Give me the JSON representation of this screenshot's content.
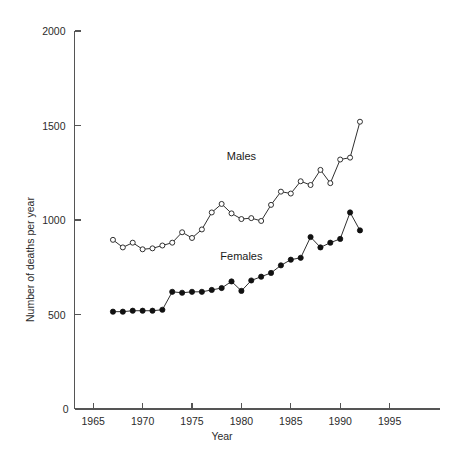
{
  "chart_data": {
    "type": "line",
    "title": "",
    "xlabel": "Year",
    "ylabel": "Number of deaths per year",
    "xlim": [
      1963,
      1997
    ],
    "ylim": [
      0,
      2000
    ],
    "grid": false,
    "legend_position": "inline-annotation",
    "x_ticks": [
      "1965",
      "1970",
      "1975",
      "1980",
      "1985",
      "1990",
      "1995"
    ],
    "x_tick_values": [
      1965,
      1970,
      1975,
      1980,
      1985,
      1990,
      1995
    ],
    "y_ticks": [
      "0",
      "500",
      "1000",
      "1500",
      "2000"
    ],
    "y_tick_values": [
      0,
      500,
      1000,
      1500,
      2000
    ],
    "origin_label": "0",
    "x": [
      1967,
      1968,
      1969,
      1970,
      1971,
      1972,
      1973,
      1974,
      1975,
      1976,
      1977,
      1978,
      1979,
      1980,
      1981,
      1982,
      1983,
      1984,
      1985,
      1986,
      1987,
      1988,
      1989,
      1990,
      1991,
      1992
    ],
    "series": [
      {
        "name": "Males",
        "marker": "open-circle",
        "color": "#303030",
        "label_x": 1980,
        "label_y": 1320,
        "values": [
          895,
          855,
          880,
          845,
          850,
          865,
          880,
          935,
          905,
          950,
          1040,
          1085,
          1035,
          1005,
          1010,
          995,
          1080,
          1150,
          1140,
          1205,
          1185,
          1265,
          1195,
          1320,
          1330,
          1520
        ]
      },
      {
        "name": "Females",
        "marker": "filled-circle",
        "color": "#111111",
        "label_x": 1980,
        "label_y": 790,
        "values": [
          515,
          515,
          520,
          520,
          520,
          525,
          620,
          615,
          620,
          620,
          630,
          640,
          675,
          625,
          680,
          700,
          720,
          760,
          790,
          800,
          910,
          855,
          880,
          900,
          1040,
          945
        ]
      }
    ]
  },
  "axis_labels": {
    "y_axis_title": "Number of deaths per year",
    "x_axis_title": "Year"
  }
}
